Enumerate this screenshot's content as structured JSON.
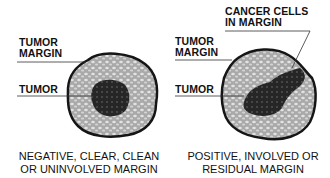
{
  "diagram": {
    "left_panel": {
      "labels": {
        "margin": "TUMOR\nMARGIN",
        "margin_line1": "TUMOR",
        "margin_line2": "MARGIN",
        "tumor": "TUMOR"
      },
      "caption_line1": "NEGATIVE, CLEAR, CLEAN",
      "caption_line2": "OR UNINVOLVED MARGIN"
    },
    "right_panel": {
      "labels": {
        "cancer_line1": "CANCER CELLS",
        "cancer_line2": "IN MARGIN",
        "margin_line1": "TUMOR",
        "margin_line2": "MARGIN",
        "tumor": "TUMOR"
      },
      "caption_line1": "POSITIVE, INVOLVED OR",
      "caption_line2": "RESIDUAL MARGIN"
    },
    "colors": {
      "margin_fill": "#b8b8b8",
      "tumor_fill": "#2a2a2a",
      "outline": "#151515"
    }
  }
}
